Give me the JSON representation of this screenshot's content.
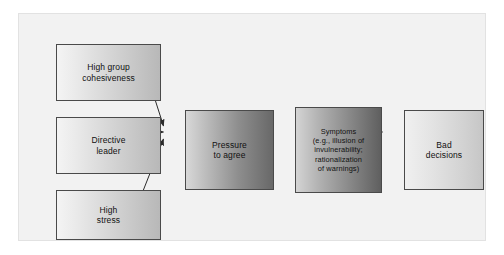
{
  "figure": {
    "kind": "flow-diagram",
    "topic": "Groupthink model",
    "frame": {
      "background_color": "#f2f2f2",
      "border_color": "#e2e2e2"
    }
  },
  "nodes": [
    {
      "id": "cohesiveness",
      "label": "High group\ncohesiveness",
      "style": "light",
      "fill_from": "#f4f4f4",
      "fill_to": "#b8b8b8",
      "border_color": "#4a4a4a"
    },
    {
      "id": "leader",
      "label": "Directive\nleader",
      "style": "light",
      "fill_from": "#f4f4f4",
      "fill_to": "#b8b8b8",
      "border_color": "#4a4a4a"
    },
    {
      "id": "stress",
      "label": "High\nstress",
      "style": "light",
      "fill_from": "#f4f4f4",
      "fill_to": "#b8b8b8",
      "border_color": "#4a4a4a"
    },
    {
      "id": "pressure",
      "label": "Pressure\nto agree",
      "style": "dark",
      "fill_from": "#d8d8d8",
      "fill_to": "#686868",
      "border_color": "#4a4a4a"
    },
    {
      "id": "symptoms",
      "label": "Symptoms\n(e.g., illusion of\ninvulnerability;\nrationalization\nof warnings)",
      "style": "dark-small",
      "fill_from": "#d4d4d4",
      "fill_to": "#5f5f5f",
      "border_color": "#4a4a4a"
    },
    {
      "id": "decisions",
      "label": "Bad\ndecisions",
      "style": "flat-light",
      "fill_from": "#f0f0f0",
      "fill_to": "#c6c6c6",
      "border_color": "#4a4a4a"
    }
  ],
  "edges": [
    {
      "id": "cohesiveness-to-pressure",
      "from": "cohesiveness",
      "to": "pressure",
      "kind": "diagonal-down"
    },
    {
      "id": "leader-to-pressure",
      "from": "leader",
      "to": "pressure",
      "kind": "straight"
    },
    {
      "id": "stress-to-pressure",
      "from": "stress",
      "to": "pressure",
      "kind": "diagonal-up"
    },
    {
      "id": "pressure-to-symptoms",
      "from": "pressure",
      "to": "symptoms",
      "kind": "straight"
    },
    {
      "id": "symptoms-to-decisions",
      "from": "symptoms",
      "to": "decisions",
      "kind": "straight"
    }
  ],
  "edge_style": {
    "stroke_color": "#2b2b2b",
    "stroke_width": 1
  }
}
